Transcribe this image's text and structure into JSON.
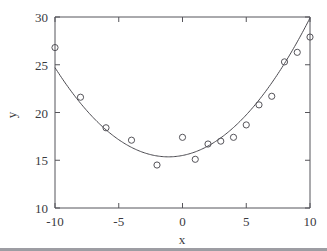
{
  "chart_data": {
    "type": "scatter",
    "title": "",
    "xlabel": "x",
    "ylabel": "y",
    "xlim": [
      -10,
      10
    ],
    "ylim": [
      10,
      30
    ],
    "xticks": [
      -10,
      -5,
      0,
      5,
      10
    ],
    "yticks": [
      10,
      15,
      20,
      25,
      30
    ],
    "xtick_labels": [
      "-10",
      "-5",
      "0",
      "5",
      "10"
    ],
    "ytick_labels": [
      "10",
      "15",
      "20",
      "25",
      "30"
    ],
    "grid": false,
    "legend": null,
    "series": [
      {
        "name": "observations",
        "marker": "open-circle",
        "color": "#55545a",
        "points": [
          {
            "x": -10,
            "y": 26.8
          },
          {
            "x": -8,
            "y": 21.6
          },
          {
            "x": -6,
            "y": 18.4
          },
          {
            "x": -4,
            "y": 17.1
          },
          {
            "x": -2,
            "y": 14.5
          },
          {
            "x": 0,
            "y": 17.4
          },
          {
            "x": 1,
            "y": 15.1
          },
          {
            "x": 2,
            "y": 16.7
          },
          {
            "x": 3,
            "y": 17.0
          },
          {
            "x": 4,
            "y": 17.4
          },
          {
            "x": 5,
            "y": 18.7
          },
          {
            "x": 6,
            "y": 20.8
          },
          {
            "x": 7,
            "y": 21.7
          },
          {
            "x": 8,
            "y": 25.3
          },
          {
            "x": 9,
            "y": 26.3
          },
          {
            "x": 10,
            "y": 27.9
          }
        ]
      },
      {
        "name": "quadratic-fit",
        "marker": "none",
        "color": "#4b4a50",
        "curve": {
          "form": "quadratic",
          "a": 0.118,
          "b": 0.26,
          "c": 15.5,
          "vertex_x": -1.1,
          "vertex_y": 15.36
        }
      }
    ]
  },
  "axes": {
    "x_axis_label": "x",
    "y_axis_label": "y"
  }
}
